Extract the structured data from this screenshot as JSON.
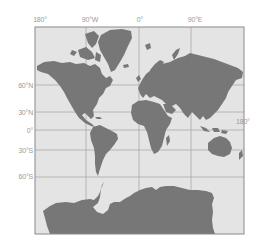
{
  "map": {
    "projection": "Mercator world map",
    "colors": {
      "ocean": "#e4e4e4",
      "land": "#777777",
      "graticule": "#a8a8a8",
      "frame": "#8a8a8a",
      "label": "#9a9a9a"
    },
    "frame": {
      "x": 35,
      "y": 27,
      "width": 209,
      "height": 207
    },
    "longitude_labels": [
      {
        "text": "180°",
        "x": 40
      },
      {
        "text": "90°W",
        "x": 90
      },
      {
        "text": "0°",
        "x": 140
      },
      {
        "text": "90°E",
        "x": 195
      }
    ],
    "latitude_labels": [
      {
        "text": "60°N",
        "y": 86
      },
      {
        "text": "30°N",
        "y": 113
      },
      {
        "text": "0°",
        "y": 131
      },
      {
        "text": "30°S",
        "y": 151
      },
      {
        "text": "60°S",
        "y": 177
      }
    ],
    "right_label": {
      "text": "180°",
      "x": 236,
      "y": 122
    },
    "meridians_x": [
      86,
      139,
      191
    ],
    "parallels_y": [
      85,
      112,
      130,
      150,
      177
    ],
    "landmasses": [
      "North America",
      "Greenland",
      "South America",
      "Europe",
      "Asia",
      "Africa",
      "Australia",
      "New Zealand",
      "Antarctica"
    ]
  }
}
